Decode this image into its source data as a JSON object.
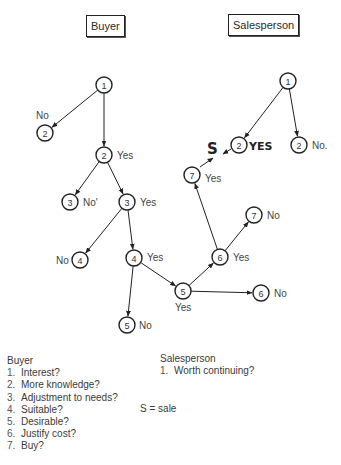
{
  "titles": {
    "buyer": "Buyer",
    "salesperson": "Salesperson"
  },
  "nodes": [
    {
      "id": "b1",
      "num": "1",
      "x": 104,
      "y": 85,
      "label": "",
      "lx": 0,
      "ly": 0
    },
    {
      "id": "b2n",
      "num": "2",
      "x": 45,
      "y": 133,
      "label": "No",
      "lx": 36,
      "ly": 119
    },
    {
      "id": "b2y",
      "num": "2",
      "x": 104,
      "y": 155,
      "label": "Yes",
      "lx": 117,
      "ly": 159
    },
    {
      "id": "b3n",
      "num": "3",
      "x": 70,
      "y": 202,
      "label": "No'",
      "lx": 83,
      "ly": 206
    },
    {
      "id": "b3y",
      "num": "3",
      "x": 127,
      "y": 202,
      "label": "Yes",
      "lx": 140,
      "ly": 206
    },
    {
      "id": "b4n",
      "num": "4",
      "x": 80,
      "y": 260,
      "label": "No",
      "lx": 56,
      "ly": 264
    },
    {
      "id": "b4y",
      "num": "4",
      "x": 134,
      "y": 258,
      "label": "Yes",
      "lx": 147,
      "ly": 261
    },
    {
      "id": "b5y",
      "num": "5",
      "x": 183,
      "y": 291,
      "label": "Yes",
      "lx": 175,
      "ly": 311
    },
    {
      "id": "b5n",
      "num": "5",
      "x": 127,
      "y": 325,
      "label": "No",
      "lx": 139,
      "ly": 329
    },
    {
      "id": "b6y",
      "num": "6",
      "x": 220,
      "y": 257,
      "label": "Yes",
      "lx": 233,
      "ly": 261
    },
    {
      "id": "b6n",
      "num": "6",
      "x": 261,
      "y": 293,
      "label": "No",
      "lx": 274,
      "ly": 297
    },
    {
      "id": "b7y",
      "num": "7",
      "x": 192,
      "y": 175,
      "label": "Yes",
      "lx": 205,
      "ly": 182
    },
    {
      "id": "b7n",
      "num": "7",
      "x": 254,
      "y": 215,
      "label": "No",
      "lx": 267,
      "ly": 219
    },
    {
      "id": "s1",
      "num": "1",
      "x": 288,
      "y": 81,
      "label": "",
      "lx": 0,
      "ly": 0
    },
    {
      "id": "s2y",
      "num": "2",
      "x": 239,
      "y": 145,
      "label": "",
      "lx": 0,
      "ly": 0
    },
    {
      "id": "s2n",
      "num": "2",
      "x": 299,
      "y": 145,
      "label": "No.",
      "lx": 312,
      "ly": 149
    }
  ],
  "edges": [
    {
      "from": "b1",
      "to": "b2n"
    },
    {
      "from": "b1",
      "to": "b2y"
    },
    {
      "from": "b2y",
      "to": "b3n"
    },
    {
      "from": "b2y",
      "to": "b3y"
    },
    {
      "from": "b3y",
      "to": "b4n"
    },
    {
      "from": "b3y",
      "to": "b4y"
    },
    {
      "from": "b4y",
      "to": "b5n"
    },
    {
      "from": "b4y",
      "to": "b5y"
    },
    {
      "from": "b5y",
      "to": "b6y"
    },
    {
      "from": "b5y",
      "to": "b6n"
    },
    {
      "from": "b6y",
      "to": "b7y"
    },
    {
      "from": "b6y",
      "to": "b7n"
    },
    {
      "from": "s1",
      "to": "s2y"
    },
    {
      "from": "s1",
      "to": "s2n"
    }
  ],
  "sale_marker": {
    "s_label": "S",
    "yes_label": "YES"
  },
  "legend": {
    "buyer_title": "Buyer",
    "buyer_items": [
      {
        "num": "1.",
        "text": "Interest?"
      },
      {
        "num": "2.",
        "text": "More knowledge?"
      },
      {
        "num": "3.",
        "text": "Adjustment to needs?"
      },
      {
        "num": "4.",
        "text": "Suitable?"
      },
      {
        "num": "5.",
        "text": "Desirable?"
      },
      {
        "num": "6.",
        "text": "Justify cost?"
      },
      {
        "num": "7.",
        "text": "Buy?"
      }
    ],
    "salesperson_title": "Salesperson",
    "salesperson_items": [
      {
        "num": "1.",
        "text": "Worth continuing?"
      }
    ],
    "key": "S = sale"
  }
}
